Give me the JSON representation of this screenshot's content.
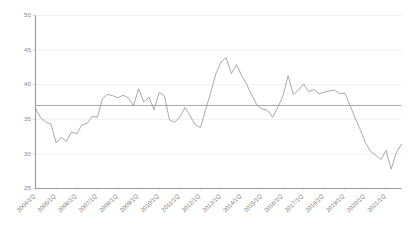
{
  "chart_data": {
    "type": "line",
    "title": "",
    "subtitle": "",
    "xlabel": "",
    "ylabel": "",
    "ylim": [
      25,
      50
    ],
    "yticks": [
      25,
      30,
      35,
      40,
      45,
      50
    ],
    "grid": true,
    "legend": false,
    "legend_position": "none",
    "x_tick_labels": [
      "2004/1Q",
      "2005/1Q",
      "2006/1Q",
      "2007/1Q",
      "2008/1Q",
      "2009/1Q",
      "2010/1Q",
      "2011/1Q",
      "2012/1Q",
      "2013/1Q",
      "2014/1Q",
      "2015/1Q",
      "2016/1Q",
      "2017/1Q",
      "2018/1Q",
      "2019/1Q",
      "2020/1Q",
      "2021/1Q"
    ],
    "x_tick_positions": [
      0,
      4,
      8,
      12,
      16,
      20,
      24,
      28,
      32,
      36,
      40,
      44,
      48,
      52,
      56,
      60,
      64,
      68
    ],
    "x": [
      "2004/1Q",
      "2004/2Q",
      "2004/3Q",
      "2004/4Q",
      "2005/1Q",
      "2005/2Q",
      "2005/3Q",
      "2005/4Q",
      "2006/1Q",
      "2006/2Q",
      "2006/3Q",
      "2006/4Q",
      "2007/1Q",
      "2007/2Q",
      "2007/3Q",
      "2007/4Q",
      "2008/1Q",
      "2008/2Q",
      "2008/3Q",
      "2008/4Q",
      "2009/1Q",
      "2009/2Q",
      "2009/3Q",
      "2009/4Q",
      "2010/1Q",
      "2010/2Q",
      "2010/3Q",
      "2010/4Q",
      "2011/1Q",
      "2011/2Q",
      "2011/3Q",
      "2011/4Q",
      "2012/1Q",
      "2012/2Q",
      "2012/3Q",
      "2012/4Q",
      "2013/1Q",
      "2013/2Q",
      "2013/3Q",
      "2013/4Q",
      "2014/1Q",
      "2014/2Q",
      "2014/3Q",
      "2014/4Q",
      "2015/1Q",
      "2015/2Q",
      "2015/3Q",
      "2015/4Q",
      "2016/1Q",
      "2016/2Q",
      "2016/3Q",
      "2016/4Q",
      "2017/1Q",
      "2017/2Q",
      "2017/3Q",
      "2017/4Q",
      "2018/1Q",
      "2018/2Q",
      "2018/3Q",
      "2018/4Q",
      "2019/1Q",
      "2019/2Q",
      "2019/3Q",
      "2019/4Q",
      "2020/1Q",
      "2020/2Q",
      "2020/3Q",
      "2020/4Q",
      "2021/1Q",
      "2021/2Q",
      "2021/3Q",
      "2021/4Q"
    ],
    "series": [
      {
        "name": "value",
        "color": "#9a9a9a",
        "values": [
          36.6,
          35.2,
          34.6,
          34.3,
          31.6,
          32.4,
          31.8,
          33.2,
          32.9,
          34.2,
          34.4,
          35.4,
          35.3,
          38.0,
          38.6,
          38.4,
          38.1,
          38.5,
          38.1,
          37.0,
          39.4,
          37.5,
          38.2,
          36.4,
          38.9,
          38.4,
          34.9,
          34.6,
          35.3,
          36.7,
          35.5,
          34.2,
          33.8,
          36.4,
          38.9,
          41.6,
          43.3,
          43.9,
          41.6,
          42.9,
          41.3,
          40.0,
          38.4,
          37.0,
          36.5,
          36.3,
          35.3,
          36.7,
          38.4,
          41.3,
          38.6,
          39.2,
          40.1,
          39.0,
          39.3,
          38.7,
          38.9,
          39.1,
          39.2,
          38.7,
          38.8,
          37.0,
          35.2,
          33.5,
          31.6,
          30.4,
          29.8,
          29.2,
          30.5,
          27.8,
          30.2,
          31.4
        ]
      }
    ],
    "reference_line": {
      "name": "average",
      "value": 37.0,
      "color": "#a9a9a9"
    },
    "final_point_value": 34.5
  }
}
